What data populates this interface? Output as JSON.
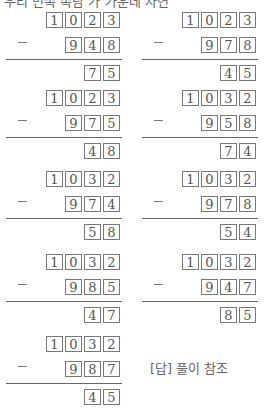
{
  "header_fragment": "우리 민속 속담 가 가운데 자연",
  "problems": [
    {
      "top": "1023",
      "sub": "948",
      "result": "75"
    },
    {
      "top": "1023",
      "sub": "978",
      "result": "45"
    },
    {
      "top": "1023",
      "sub": "975",
      "result": "48"
    },
    {
      "top": "1032",
      "sub": "958",
      "result": "74"
    },
    {
      "top": "1032",
      "sub": "974",
      "result": "58"
    },
    {
      "top": "1032",
      "sub": "978",
      "result": "54"
    },
    {
      "top": "1032",
      "sub": "985",
      "result": "47"
    },
    {
      "top": "1032",
      "sub": "947",
      "result": "85"
    },
    {
      "top": "1032",
      "sub": "987",
      "result": "45"
    }
  ],
  "operator": "−",
  "answer_label": "[답] 풀이 참조"
}
